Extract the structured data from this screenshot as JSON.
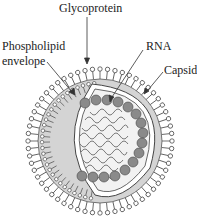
{
  "diagram": {
    "labels": {
      "glycoprotein": "Glycoprotein",
      "phospholipid_line1": "Phospholipid",
      "phospholipid_line2": "envelope",
      "rna": "RNA",
      "capsid": "Capsid"
    },
    "colors": {
      "envelope_fill": "#d4d4d4",
      "capsid_fill": "#f2f2f2",
      "capsomere_fill": "#8a8a8a",
      "rna_stroke": "#7a7a7a",
      "line": "#333333"
    }
  }
}
